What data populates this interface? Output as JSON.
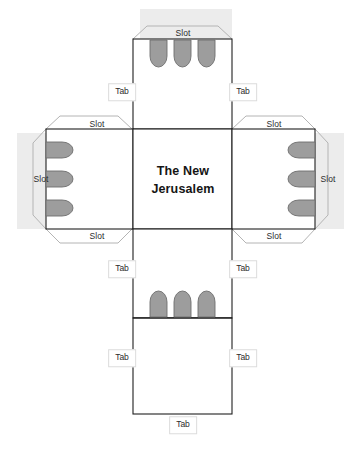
{
  "document": {
    "type": "papercraft-cube-net",
    "title": "The New Jerusalem",
    "title_line_1": "The New",
    "title_line_2": "Jerusalem",
    "background_color": "#ffffff",
    "line_color": "#1f1f1f",
    "flap_line_color": "#b0b0b0",
    "tongue_fill": "#9d9d9d",
    "tongue_stroke": "#6e6e6e",
    "shade_color": "#eaeaea",
    "label_color": "#2b2b2b"
  },
  "faces": {
    "top": {
      "name": "top-face"
    },
    "left": {
      "name": "left-face"
    },
    "center": {
      "name": "center-face"
    },
    "right": {
      "name": "right-face"
    },
    "bottom": {
      "name": "bottom-face"
    },
    "bottom_extra": {
      "name": "bottom-extra-face"
    }
  },
  "flaps": {
    "slot_label": "Slot",
    "tab_label": "Tab",
    "slots": [
      {
        "id": "slot-top",
        "label": "Slot",
        "x": 183,
        "y": 33
      },
      {
        "id": "slot-left-top",
        "label": "Slot",
        "x": 97,
        "y": 124
      },
      {
        "id": "slot-left-side",
        "label": "Slot",
        "x": 40,
        "y": 179
      },
      {
        "id": "slot-left-bottom",
        "label": "Slot",
        "x": 97,
        "y": 236
      },
      {
        "id": "slot-right-top",
        "label": "Slot",
        "x": 274,
        "y": 124
      },
      {
        "id": "slot-right-side",
        "label": "Slot",
        "x": 328,
        "y": 179
      },
      {
        "id": "slot-right-bottom",
        "label": "Slot",
        "x": 274,
        "y": 236
      }
    ],
    "tabs": [
      {
        "id": "tab-top-left",
        "label": "Tab",
        "x": 122,
        "y": 92
      },
      {
        "id": "tab-top-right",
        "label": "Tab",
        "x": 243,
        "y": 92
      },
      {
        "id": "tab-mid-left",
        "label": "Tab",
        "x": 122,
        "y": 269
      },
      {
        "id": "tab-mid-right",
        "label": "Tab",
        "x": 243,
        "y": 269
      },
      {
        "id": "tab-low-left",
        "label": "Tab",
        "x": 122,
        "y": 358
      },
      {
        "id": "tab-low-right",
        "label": "Tab",
        "x": 243,
        "y": 358
      },
      {
        "id": "tab-bottom",
        "label": "Tab",
        "x": 183,
        "y": 425
      }
    ]
  },
  "tongues": {
    "top": {
      "count": 3,
      "direction": "down"
    },
    "left": {
      "count": 3,
      "direction": "left"
    },
    "right": {
      "count": 3,
      "direction": "right"
    },
    "bottom": {
      "count": 3,
      "direction": "up"
    }
  }
}
